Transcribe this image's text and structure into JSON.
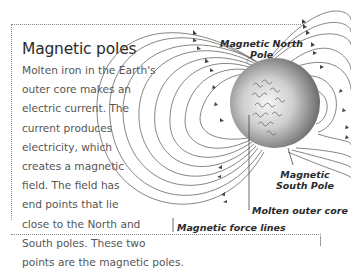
{
  "article": {
    "title": "Magnetic poles",
    "body_lines": [
      "Molten iron in the Earth's",
      "outer core makes an",
      "electric current. The",
      "current produces",
      "electricity, which",
      "creates a magnetic",
      "field. The field has",
      "end points that lie",
      "close to the North and",
      "South poles. These two",
      "points are the magnetic poles."
    ]
  },
  "diagram": {
    "labels": {
      "north_pole_line1": "Magnetic North",
      "north_pole_line2": "Pole",
      "south_pole_line1": "Magnetic",
      "south_pole_line2": "South Pole",
      "outer_core": "Molten outer core",
      "force_lines": "Magnetic force lines"
    },
    "colors": {
      "line": "#555555",
      "sphere_light": "#f4f4f4",
      "sphere_dark": "#6e6e6e"
    }
  }
}
